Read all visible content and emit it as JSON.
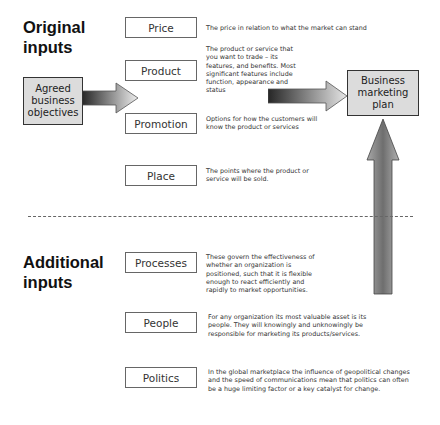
{
  "headings": {
    "original": "Original inputs",
    "original_lines": [
      "Original",
      "inputs"
    ],
    "additional_lines": [
      "Additional",
      "inputs"
    ]
  },
  "agreed_objectives": {
    "lines": [
      "Agreed",
      "business",
      "objectives"
    ]
  },
  "business_plan": {
    "lines": [
      "Business",
      "marketing",
      "plan"
    ]
  },
  "original_inputs": [
    {
      "label": "Price",
      "description": "The price in relation to what the market can stand"
    },
    {
      "label": "Product",
      "description": "The product or service that you want to trade – its features, and benefits. Most significant features include function, appearance and status"
    },
    {
      "label": "Promotion",
      "description": "Options for how the customers will know the product or services"
    },
    {
      "label": "Place",
      "description": "The points where the product or service will be sold."
    }
  ],
  "additional_inputs": [
    {
      "label": "Processes",
      "description": "These govern the effectiveness of whether an organization is positioned, such that it is flexible enough to react efficiently and rapidly to market opportunities."
    },
    {
      "label": "People",
      "description": "For any organization its most valuable asset is its people. They will knowingly and unknowingly be responsible for marketing its products/services."
    },
    {
      "label": "Politics",
      "description": "In the global marketplace the influence of geopolitical changes and the speed of communications mean that politics can often be a huge limiting factor or a key catalyst for change."
    }
  ],
  "colors": {
    "box_fill": "#dcdcdc",
    "arrow_dark": "#2a2a2a",
    "arrow_light": "#e8e8e8",
    "divider": "#666666"
  }
}
